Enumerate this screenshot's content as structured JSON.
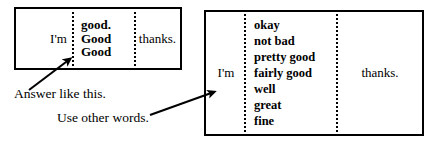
{
  "example_box": {
    "subject": "I'm",
    "options": [
      "good.",
      "Good",
      "Good"
    ],
    "tail": "thanks."
  },
  "alternatives_box": {
    "subject": "I'm",
    "options": [
      "okay",
      "not bad",
      "pretty good",
      "fairly good",
      "well",
      "great",
      "fine"
    ],
    "tail": "thanks."
  },
  "captions": {
    "answer_like_this": "Answer like this.",
    "use_other_words": "Use other words."
  },
  "colors": {
    "ink": "#000000",
    "paper": "#ffffff"
  },
  "icons": {
    "arrow_to_example": "arrow-up-right-icon",
    "arrow_to_alternatives": "arrow-up-right-icon"
  }
}
